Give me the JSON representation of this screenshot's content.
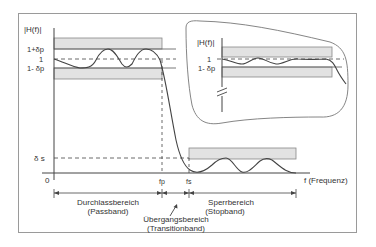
{
  "diagram": {
    "colors": {
      "frame": "#9a9a9a",
      "axis": "#444444",
      "curve": "#444444",
      "band_fill": "#e2e2e2",
      "band_stroke": "#888888",
      "text": "#333333"
    },
    "main_plot": {
      "y_axis_label": "|H(f)|",
      "y_ticks": {
        "upper": "1+δp",
        "one": "1",
        "lower": "1- δp",
        "stop": "δ s",
        "zero": "0"
      },
      "x_ticks": {
        "fp": "fp",
        "fs": "fs"
      },
      "x_axis_label": "f (Frequenz)"
    },
    "regions": {
      "passband": {
        "line1": "Durchlassbereich",
        "line2": "(Passband)"
      },
      "transition": {
        "line1": "Übergangsbereich",
        "line2": "(Transitionband)"
      },
      "stopband": {
        "line1": "Sperrbereich",
        "line2": "(Stopband)"
      }
    },
    "inset": {
      "y_axis_label": "|H(f)|",
      "y_ticks": {
        "one": "1",
        "lower": "1- δp"
      },
      "axis_break": "//"
    }
  }
}
